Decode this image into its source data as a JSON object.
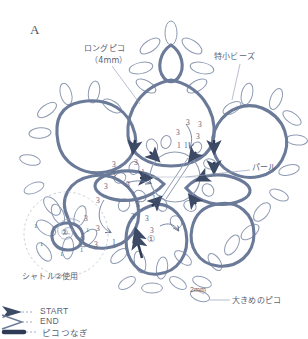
{
  "page": {
    "title_letter": "A",
    "top_cut_text": "　　　",
    "bg_color": "#ffffff",
    "thread_color": "#6b7a99",
    "thin_color": "#8f9bb3",
    "text_color": "#5a6275"
  },
  "annotations": {
    "long_picot": {
      "line1": "ロングピコ",
      "line2": "（4mm）"
    },
    "tiny_beads": "特小ビーズ",
    "pearl": "パール",
    "shuttle_use": "シャトル②使用",
    "large_picot": "大きめのピコ",
    "size_2mm": "2mm",
    "ring_marker_1": "①",
    "ring_marker_2": "②"
  },
  "legend": {
    "items": [
      {
        "label": "START",
        "symbol": "solid-arrow",
        "color": "#3d4a66"
      },
      {
        "label": "END",
        "symbol": "open-arrow",
        "color": "#6b7a99"
      },
      {
        "label": "ピコつなぎ",
        "symbol": "thick-bar",
        "color": "#2f3a55"
      }
    ]
  },
  "stitch_numbers": {
    "upper_right_petal": [
      "3",
      "3",
      "3",
      "3",
      "1",
      "1"
    ],
    "left_petal": [
      "3",
      "3",
      "3",
      "3",
      "1",
      "3"
    ],
    "lower_center_petal": [
      "3",
      "1",
      "1",
      "3",
      "3",
      "3"
    ],
    "lower_left_petal": [
      "3",
      "3",
      "3",
      "3",
      "1"
    ],
    "bottom_left_ring": [
      "1",
      "1",
      "1",
      "1",
      "1"
    ]
  },
  "structure": {
    "type": "tatting-motif-diagram",
    "center_rings": 1,
    "large_petals": 6,
    "outer_picot_loops": "many"
  }
}
